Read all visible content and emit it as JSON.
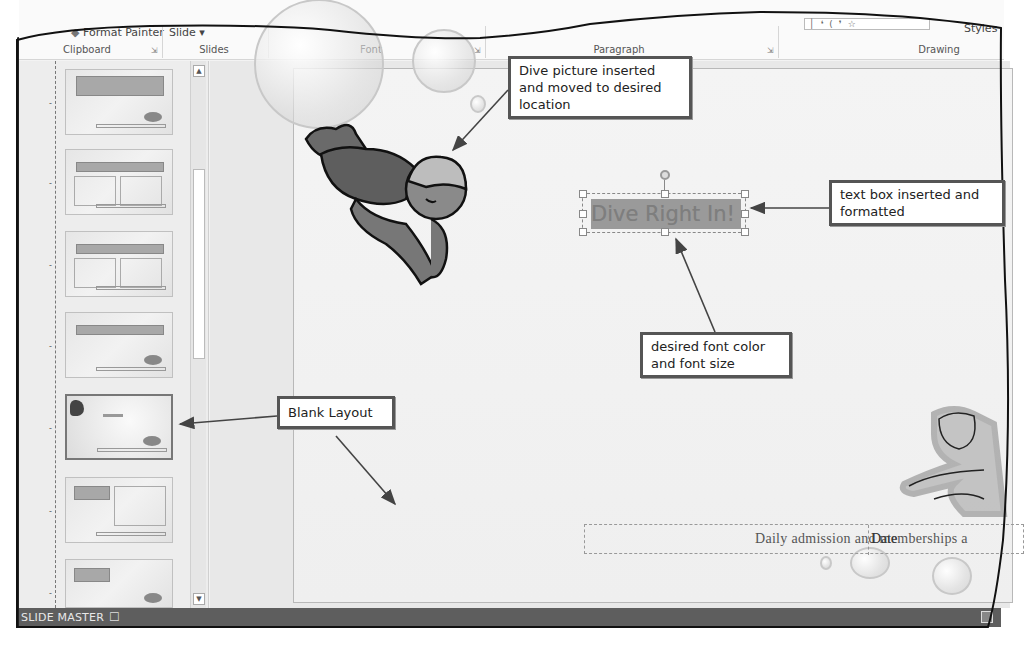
{
  "ribbon": {
    "top_items": {
      "format_painter": "Format Painter",
      "slide_dropdown": "Slide ▾",
      "styles": "Styles"
    },
    "groups": [
      {
        "label": "Clipboard",
        "launcher": "⇲"
      },
      {
        "label": "Slides"
      },
      {
        "label": "Font",
        "launcher": "⇲"
      },
      {
        "label": "Paragraph",
        "launcher": "⇲"
      },
      {
        "label": "Drawing"
      }
    ]
  },
  "thumbnail_pane": {
    "thumbnails": [
      {
        "layout": "Title Slide Layout",
        "selected": false
      },
      {
        "layout": "Two Content Layout",
        "selected": false
      },
      {
        "layout": "Comparison Layout",
        "selected": false
      },
      {
        "layout": "Title Only Layout",
        "selected": false
      },
      {
        "layout": "Blank Layout",
        "selected": true
      },
      {
        "layout": "Content with Caption Layout",
        "selected": false
      },
      {
        "layout": "Picture with Caption Layout",
        "selected": false
      }
    ],
    "scroll_up": "▲",
    "scroll_down": "▼"
  },
  "slide": {
    "textbox_text": "Dive Right In!",
    "footer_text": "Daily admission and memberships a",
    "date_placeholder": "Date",
    "colors": {
      "textbox_fill": "#9a9a9a",
      "textbox_font": "#7e7e7e"
    }
  },
  "status_bar": {
    "view_label": "SLIDE MASTER",
    "notes_icon": "☐"
  },
  "callouts": {
    "dive_picture": "Dive picture inserted and moved to desired location",
    "text_box": "text box inserted and formatted",
    "font_color": "desired font color and font size",
    "blank_layout": "Blank Layout"
  }
}
